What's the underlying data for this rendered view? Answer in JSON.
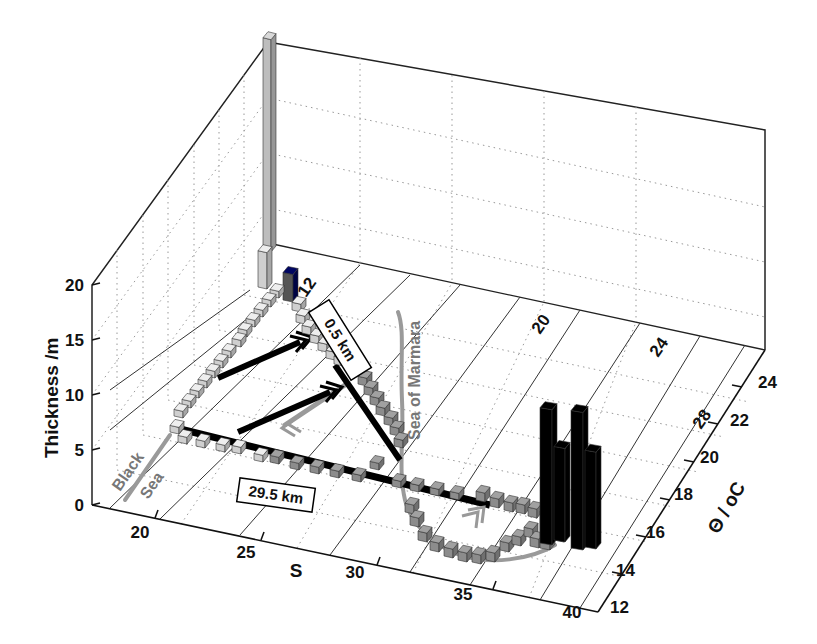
{
  "chart_data": {
    "type": "3d-bar-histogram",
    "title": "",
    "xlabel": "S",
    "ylabel": "Θ / oC",
    "zlabel": "Thickness /m",
    "x_ticks": [
      "20",
      "25",
      "30",
      "35",
      "40"
    ],
    "y_ticks": [
      "12",
      "14",
      "16",
      "18",
      "20",
      "22",
      "24"
    ],
    "z_ticks": [
      "0",
      "5",
      "10",
      "15",
      "20"
    ],
    "xlim": [
      17,
      40
    ],
    "ylim": [
      12,
      25
    ],
    "zlim": [
      0,
      20
    ],
    "density_contours": [
      "12",
      "20",
      "24",
      "28"
    ],
    "grid": true,
    "annotations": {
      "black_sea_1": "Black",
      "black_sea_2": "Sea",
      "marmara": "Sea of Marmara",
      "box_upper": "0.5 km",
      "box_lower": "29.5 km"
    },
    "series": [
      {
        "name": "Black Sea end-member (light grey bars)",
        "color": "#c8c8c8",
        "notable": [
          {
            "S": 17.5,
            "theta": 24.5,
            "thickness": 20.5
          },
          {
            "S": 17.5,
            "theta": 23,
            "thickness": 5
          }
        ]
      },
      {
        "name": "Marmara profile (medium grey bars)",
        "color": "#8a8a8a",
        "notable": [
          {
            "S": 38.5,
            "theta": 14.5,
            "thickness": 3
          }
        ]
      },
      {
        "name": "Mediterranean end-member (black bars)",
        "color": "#000000",
        "notable": [
          {
            "S": 38.9,
            "theta": 15.5,
            "thickness": 14
          },
          {
            "S": 38.9,
            "theta": 16.5,
            "thickness": 11
          },
          {
            "S": 39.0,
            "theta": 14.5,
            "thickness": 13
          },
          {
            "S": 39.0,
            "theta": 15.5,
            "thickness": 9.5
          }
        ]
      }
    ]
  },
  "labels": {
    "zlabel": "Thickness /m",
    "xlabel": "S",
    "ylabel": "Θ / oC",
    "z0": "0",
    "z5": "5",
    "z10": "10",
    "z15": "15",
    "z20": "20",
    "x20": "20",
    "x25": "25",
    "x30": "30",
    "x35": "35",
    "x40": "40",
    "y12": "12",
    "y14": "14",
    "y16": "16",
    "y18": "18",
    "y20": "20",
    "y22": "22",
    "y24": "24",
    "c12": "12",
    "c20": "20",
    "c24": "24",
    "c28": "28",
    "black": "Black",
    "sea": "Sea",
    "marmara": "Sea of Marmara",
    "box_upper": "0.5 km",
    "box_lower": "29.5 km"
  }
}
